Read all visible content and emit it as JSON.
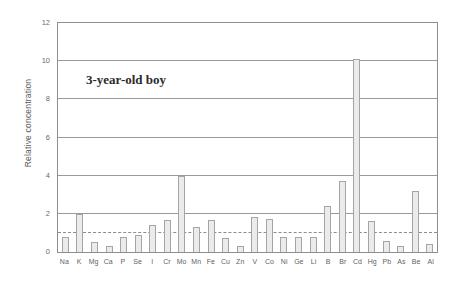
{
  "chart_data": {
    "type": "bar",
    "title": "",
    "annotation": "3-year-old boy",
    "xlabel": "",
    "ylabel": "Relative concentration",
    "ylim": [
      0,
      12
    ],
    "yticks": [
      0,
      2,
      4,
      6,
      8,
      10,
      12
    ],
    "ytick_labels": [
      "0",
      "2",
      "4",
      "6",
      "8",
      "10",
      "12"
    ],
    "grid": true,
    "legend": "none",
    "reference_line": {
      "value": 1,
      "style": "dashed",
      "color": "#8d8d8d"
    },
    "bar_color": "#eceaea",
    "bar_edge_color": "#a6a4a4",
    "categories": [
      "Na",
      "K",
      "Mg",
      "Ca",
      "P",
      "Se",
      "I",
      "Cr",
      "Mo",
      "Mn",
      "Fe",
      "Cu",
      "Zn",
      "V",
      "Co",
      "Ni",
      "Ge",
      "Li",
      "B",
      "Br",
      "Cd",
      "Hg",
      "Pb",
      "As",
      "Be",
      "Al"
    ],
    "values": [
      0.8,
      2.0,
      0.5,
      0.3,
      0.8,
      0.9,
      1.4,
      1.7,
      4.0,
      1.3,
      1.7,
      0.75,
      0.3,
      1.85,
      1.75,
      0.8,
      0.8,
      0.8,
      2.4,
      3.7,
      10.1,
      1.6,
      0.6,
      0.3,
      3.2,
      0.4
    ]
  }
}
